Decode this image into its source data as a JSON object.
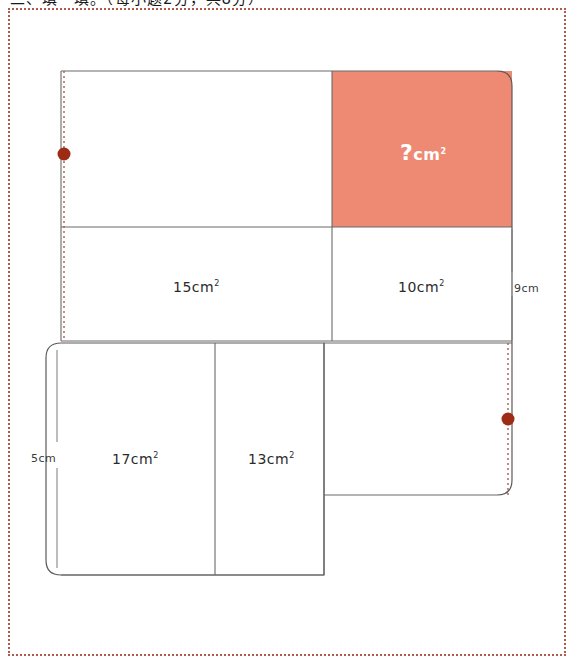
{
  "heading": {
    "text": "二、填一填。（每小题2分，共8分）"
  },
  "figure": {
    "colors": {
      "highlight_fill": "#ee8a73",
      "stroke": "#6a6a6a",
      "marker": "#9e2b14",
      "dotted_guide": "#b05a4a",
      "page_border": "#b05a4a",
      "label_text": "#2b2b2b",
      "highlight_text": "#ffffff"
    },
    "regions": [
      {
        "id": "unknown",
        "label": "?",
        "unit": "cm",
        "exponent": "2",
        "highlighted": true,
        "x": 409,
        "y": 155
      },
      {
        "id": "area-15",
        "label": "15",
        "unit": "cm",
        "exponent": "2",
        "highlighted": false,
        "x": 176,
        "y": 288
      },
      {
        "id": "area-10",
        "label": "10",
        "unit": "cm",
        "exponent": "2",
        "highlighted": false,
        "x": 400,
        "y": 288
      },
      {
        "id": "area-17",
        "label": "17",
        "unit": "cm",
        "exponent": "2",
        "highlighted": false,
        "x": 115,
        "y": 460
      },
      {
        "id": "area-13",
        "label": "13",
        "unit": "cm",
        "exponent": "2",
        "highlighted": false,
        "x": 251,
        "y": 460
      }
    ],
    "dimensions": [
      {
        "id": "right-height",
        "text": "9cm",
        "x": 513,
        "y": 283
      },
      {
        "id": "left-height",
        "text": "5cm",
        "x": 31,
        "y": 454
      }
    ],
    "markers": [
      {
        "id": "left-vertex-marker",
        "cx": 64,
        "cy": 154
      },
      {
        "id": "right-vertex-marker",
        "cx": 508,
        "cy": 419
      }
    ]
  }
}
